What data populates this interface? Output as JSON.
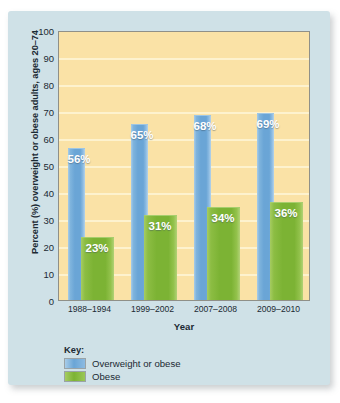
{
  "chart_data": {
    "type": "bar",
    "title": "",
    "xlabel": "Year",
    "ylabel": "Percent (%) overweight or obese adults, ages 20–74",
    "categories": [
      "1988–1994",
      "1999–2002",
      "2007–2008",
      "2009–2010"
    ],
    "ylim": [
      0,
      100
    ],
    "y_ticks": [
      100,
      90,
      80,
      70,
      60,
      50,
      40,
      30,
      20,
      10,
      0
    ],
    "grid": true,
    "legend_position": "below-left",
    "series": [
      {
        "name": "Overweight or obese",
        "color": "#6aa5d6",
        "values": [
          56,
          65,
          68,
          69
        ],
        "labels": [
          "56%",
          "65%",
          "68%",
          "69%"
        ]
      },
      {
        "name": "Obese",
        "color": "#7cb334",
        "values": [
          23,
          31,
          34,
          36
        ],
        "labels": [
          "23%",
          "31%",
          "34%",
          "36%"
        ]
      }
    ]
  },
  "legend": {
    "title": "Key:",
    "items": [
      {
        "label": "Overweight or obese",
        "swatch": "blue"
      },
      {
        "label": "Obese",
        "swatch": "green"
      }
    ]
  },
  "colors": {
    "card_background": "#cfe1e7",
    "plot_background": "#fae2a6",
    "gridline": "#fdf2ce",
    "plot_border": "#8f9088",
    "series_blue": "#6aa5d6",
    "series_green": "#7cb334",
    "text": "#1b2a33"
  }
}
